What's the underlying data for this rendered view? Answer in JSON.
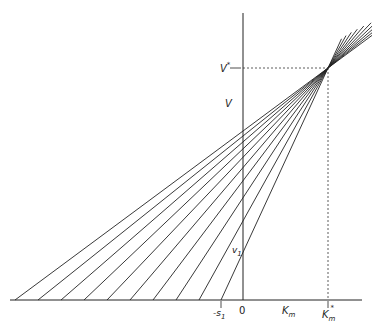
{
  "diagram": {
    "type": "direct-linear-plot",
    "labels": {
      "v_axis": "V",
      "v_star": "V",
      "v_star_sup": "*",
      "v1": "v",
      "v1_sub": "1",
      "origin": "0",
      "neg_s1": "-s",
      "neg_s1_sub": "1",
      "km_axis": "K",
      "km_axis_sub": "m",
      "km_star": "K",
      "km_star_sub": "m",
      "km_star_sup": "*"
    },
    "colors": {
      "line": "#222222",
      "background": "#ffffff"
    },
    "intersection": {
      "x": 328,
      "y": 68
    },
    "x_intercepts": [
      15,
      38,
      61,
      84,
      107,
      130,
      153,
      176,
      199,
      221
    ]
  }
}
